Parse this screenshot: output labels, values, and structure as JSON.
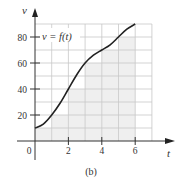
{
  "chart_data": {
    "type": "line",
    "title": "",
    "caption": "(b)",
    "xlabel": "t",
    "ylabel": "v",
    "curve_label": "v = f(t)",
    "xlim": [
      0,
      7
    ],
    "ylim": [
      0,
      90
    ],
    "grid": true,
    "x_ticks": [
      "0",
      "2",
      "4",
      "6"
    ],
    "y_ticks": [
      "20",
      "40",
      "60",
      "80"
    ],
    "series": [
      {
        "name": "v = f(t)",
        "x": [
          0,
          0.5,
          1,
          1.5,
          2,
          2.5,
          3,
          3.5,
          4,
          4.5,
          5,
          5.5,
          6
        ],
        "values": [
          10,
          13,
          20,
          29,
          40,
          51,
          60,
          66,
          70,
          74,
          80,
          86,
          90
        ]
      }
    ],
    "shaded_rectangles": {
      "description": "Left-endpoint rectangles under curve",
      "intervals": [
        [
          0,
          1
        ],
        [
          1,
          2
        ],
        [
          2,
          3
        ],
        [
          3,
          4
        ],
        [
          4,
          5
        ],
        [
          5,
          6
        ]
      ],
      "heights": [
        10,
        20,
        40,
        60,
        70,
        80
      ]
    }
  },
  "colors": {
    "curve": "#222222",
    "grid": "#c8c8c8",
    "shade": "#efefef",
    "axis": "#333333"
  }
}
